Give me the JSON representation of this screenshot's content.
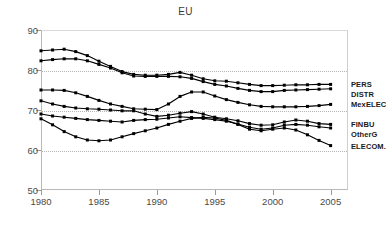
{
  "chart_data": {
    "type": "line",
    "title": "EU",
    "xlabel": "",
    "ylabel": "",
    "xlim": [
      1980,
      2006.5
    ],
    "ylim": [
      50,
      90
    ],
    "yticks": [
      50,
      60,
      70,
      80,
      90
    ],
    "ytick_labels": [
      "50",
      "60",
      "70",
      "80",
      "90"
    ],
    "xticks": [
      1980,
      1985,
      1990,
      1995,
      2000,
      2005
    ],
    "xtick_labels": [
      "1980",
      "1985",
      "1990",
      "1995",
      "2000",
      "2005"
    ],
    "gridlines": [
      60,
      70,
      80
    ],
    "grid": true,
    "legend_position": "right-inline",
    "marker": "square",
    "line_color": "#000000",
    "x": [
      1980,
      1981,
      1982,
      1983,
      1984,
      1985,
      1986,
      1987,
      1988,
      1989,
      1990,
      1991,
      1992,
      1993,
      1994,
      1995,
      1996,
      1997,
      1998,
      1999,
      2000,
      2001,
      2002,
      2003,
      2004,
      2005
    ],
    "series": [
      {
        "name": "PERS",
        "label": "PERS",
        "values": [
          84.8,
          85.0,
          85.2,
          84.6,
          83.6,
          82.2,
          80.9,
          79.6,
          78.9,
          78.7,
          78.7,
          78.9,
          79.4,
          78.7,
          77.8,
          77.3,
          77.2,
          76.8,
          76.4,
          76.1,
          76.1,
          76.2,
          76.3,
          76.3,
          76.4,
          76.4
        ]
      },
      {
        "name": "DISTR",
        "label": "DISTR",
        "values": [
          82.3,
          82.6,
          82.8,
          82.8,
          82.3,
          81.4,
          80.5,
          79.3,
          78.5,
          78.4,
          78.4,
          78.4,
          78.3,
          77.9,
          77.1,
          76.4,
          76.0,
          75.4,
          74.9,
          74.6,
          74.6,
          74.9,
          75.0,
          75.1,
          75.2,
          75.3
        ]
      },
      {
        "name": "MexELEC",
        "label": "MexELEC",
        "values": [
          75.0,
          75.0,
          74.9,
          74.3,
          73.4,
          72.4,
          71.5,
          70.9,
          70.3,
          70.2,
          70.1,
          71.5,
          73.4,
          74.5,
          74.5,
          73.5,
          72.6,
          71.9,
          71.3,
          70.9,
          70.8,
          70.8,
          70.8,
          70.9,
          71.1,
          71.4
        ]
      },
      {
        "name": "FINBU",
        "label": "FINBU",
        "values": [
          72.3,
          71.5,
          70.9,
          70.5,
          70.3,
          70.2,
          70.0,
          69.8,
          69.8,
          69.0,
          68.4,
          68.7,
          69.2,
          69.6,
          69.0,
          68.2,
          67.8,
          67.3,
          66.6,
          66.2,
          66.3,
          67.0,
          67.5,
          67.2,
          66.6,
          66.4
        ]
      },
      {
        "name": "OtherG",
        "label": "OtherG",
        "values": [
          69.0,
          68.5,
          68.2,
          67.9,
          67.6,
          67.4,
          67.2,
          67.0,
          67.4,
          67.6,
          67.7,
          68.0,
          68.3,
          68.1,
          67.9,
          67.6,
          67.2,
          66.5,
          65.7,
          65.2,
          65.5,
          66.2,
          66.4,
          66.2,
          65.8,
          65.5
        ]
      },
      {
        "name": "ELECOM.",
        "label": "ELECOM.",
        "values": [
          67.8,
          66.3,
          64.6,
          63.3,
          62.5,
          62.3,
          62.5,
          63.3,
          64.1,
          64.8,
          65.5,
          66.4,
          67.2,
          67.9,
          68.2,
          68.0,
          67.4,
          66.4,
          65.2,
          64.8,
          65.2,
          65.5,
          65.0,
          63.8,
          62.4,
          61.1
        ]
      }
    ]
  }
}
